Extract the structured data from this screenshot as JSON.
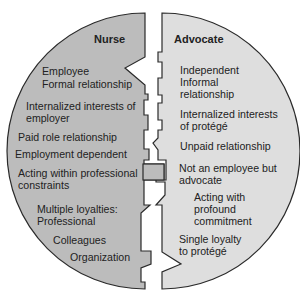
{
  "diagram": {
    "type": "split-circle-comparison",
    "colors": {
      "nurse_fill": "#bcbcbc",
      "advocate_fill": "#dedede",
      "stroke": "#2a2a2a",
      "background": "#ffffff",
      "text": "#222222"
    },
    "nurse": {
      "title": "Nurse",
      "items": [
        {
          "lines": [
            "Employee",
            "Formal relationship"
          ]
        },
        {
          "lines": [
            "Internalized interests of",
            "employer"
          ]
        },
        {
          "lines": [
            "Paid role relationship"
          ]
        },
        {
          "lines": [
            "Employment dependent"
          ]
        },
        {
          "lines": [
            "Acting within professional",
            "constraints"
          ]
        },
        {
          "lines": [
            "Multiple loyalties:",
            "Professional"
          ]
        },
        {
          "lines": [
            "Colleagues"
          ]
        },
        {
          "lines": [
            "Organization"
          ]
        }
      ]
    },
    "advocate": {
      "title": "Advocate",
      "items": [
        {
          "lines": [
            "Independent",
            "Informal",
            "relationship"
          ]
        },
        {
          "lines": [
            "Internalized interests",
            "of protégé"
          ]
        },
        {
          "lines": [
            "Unpaid relationship"
          ]
        },
        {
          "lines": [
            "Not an employee but",
            "advocate"
          ]
        },
        {
          "lines": [
            "Acting with",
            "profound",
            "commitment"
          ]
        },
        {
          "lines": [
            "Single loyalty",
            "to protégé"
          ]
        }
      ]
    }
  }
}
